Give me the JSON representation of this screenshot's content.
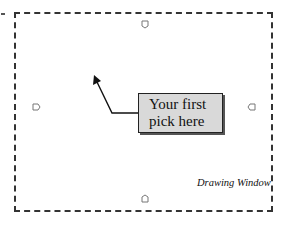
{
  "diagram": {
    "window_label": "Drawing Window",
    "callout": {
      "line1": "Your first",
      "line2": "pick here"
    },
    "handles": [
      {
        "position": "top",
        "icon": "pointer-handle-icon"
      },
      {
        "position": "left",
        "icon": "pointer-handle-icon"
      },
      {
        "position": "right",
        "icon": "pointer-handle-icon"
      },
      {
        "position": "bottom",
        "icon": "pointer-handle-icon"
      }
    ],
    "colors": {
      "border": "#333333",
      "callout_fill": "#d9d9d9",
      "callout_border": "#222222",
      "text": "#111111"
    }
  }
}
